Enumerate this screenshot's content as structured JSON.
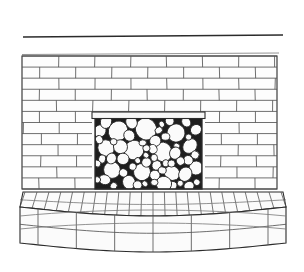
{
  "illustration": {
    "title": "Brick fireplace with cobblestone firebox and raised curved hearth",
    "caption": "",
    "medium": "line drawing",
    "background_color": "#ffffff",
    "ink_color": "#2b2b2b"
  },
  "canvas": {
    "width": 304,
    "height": 272
  },
  "parts": {
    "ceiling_line": {
      "label": "ceiling line",
      "x1": 23,
      "y1": 37,
      "x2": 283,
      "y2": 35
    },
    "wall": {
      "label": "brick chimney breast",
      "x": 22,
      "y": 56,
      "width": 255,
      "height": 133,
      "bond": "running bond",
      "rows": 12,
      "row_height": 11,
      "brick_width": 36,
      "mortar_color": "#8a8a8a"
    },
    "firebox": {
      "label": "firebox opening",
      "x": 95,
      "y": 113,
      "width": 107,
      "height": 76,
      "fill_color": "#1e1e1e",
      "contents": "river cobbles",
      "stone_count": 62,
      "lintel": {
        "label": "lintel",
        "x": 92,
        "y": 113,
        "width": 113,
        "height": 7
      }
    },
    "hearth": {
      "label": "raised curved hearth",
      "top_label": "hearth top, radiating brick",
      "face_label": "hearth front face",
      "top_y": 189,
      "front_y": 216,
      "bottom_y": 252,
      "left_x": 20,
      "right_x": 286,
      "top_courses": 22,
      "face_rows": 2,
      "face_columns": 6,
      "curvature": "convex toward viewer"
    }
  },
  "colors": {
    "paper": "#ffffff",
    "line": "#2b2b2b",
    "line_soft": "#555555",
    "line_faint": "#777777",
    "stone_fill": "#fbfbfb",
    "firebox_dark": "#1e1e1e"
  }
}
